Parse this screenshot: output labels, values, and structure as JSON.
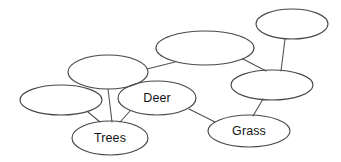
{
  "diagram": {
    "type": "concept-map",
    "background_color": "#ffffff",
    "stroke_color": "#4a4744",
    "edge_color": "#55524f",
    "text_color": "#141414",
    "canvas": {
      "width": 341,
      "height": 162
    },
    "nodes": [
      {
        "id": "node-top-right",
        "label": "",
        "cx": 292,
        "cy": 24,
        "rx": 36,
        "ry": 15
      },
      {
        "id": "node-top-middle",
        "label": "",
        "cx": 205,
        "cy": 48,
        "rx": 49,
        "ry": 17
      },
      {
        "id": "node-right-middle",
        "label": "",
        "cx": 272,
        "cy": 85,
        "rx": 41,
        "ry": 15
      },
      {
        "id": "node-upper-left",
        "label": "",
        "cx": 108,
        "cy": 72,
        "rx": 40,
        "ry": 17
      },
      {
        "id": "node-far-left",
        "label": "",
        "cx": 61,
        "cy": 100,
        "rx": 41,
        "ry": 15
      },
      {
        "id": "node-deer",
        "label": "Deer",
        "cx": 157,
        "cy": 98,
        "rx": 39,
        "ry": 17
      },
      {
        "id": "node-trees",
        "label": "Trees",
        "cx": 110,
        "cy": 138,
        "rx": 38,
        "ry": 17
      },
      {
        "id": "node-grass",
        "label": "Grass",
        "cx": 249,
        "cy": 131,
        "rx": 41,
        "ry": 16
      }
    ],
    "edges": [
      {
        "id": "edge-top-right-to-right-middle",
        "from": "node-top-right",
        "to": "node-right-middle",
        "x1": 285,
        "y1": 39,
        "x2": 281,
        "y2": 71
      },
      {
        "id": "edge-top-middle-to-right-middle",
        "from": "node-top-middle",
        "to": "node-right-middle",
        "x1": 243,
        "y1": 59,
        "x2": 266,
        "y2": 71
      },
      {
        "id": "edge-upper-left-to-top-middle",
        "from": "node-upper-left",
        "to": "node-top-middle",
        "x1": 147,
        "y1": 69,
        "x2": 175,
        "y2": 62
      },
      {
        "id": "edge-upper-left-to-trees",
        "from": "node-upper-left",
        "to": "node-trees",
        "x1": 108,
        "y1": 89,
        "x2": 112,
        "y2": 122
      },
      {
        "id": "edge-far-left-to-trees",
        "from": "node-far-left",
        "to": "node-trees",
        "x1": 88,
        "y1": 112,
        "x2": 100,
        "y2": 122
      },
      {
        "id": "edge-deer-to-trees",
        "from": "node-deer",
        "to": "node-trees",
        "x1": 130,
        "y1": 111,
        "x2": 120,
        "y2": 122
      },
      {
        "id": "edge-deer-to-grass",
        "from": "node-deer",
        "to": "node-grass",
        "x1": 189,
        "y1": 109,
        "x2": 215,
        "y2": 122
      },
      {
        "id": "edge-right-middle-to-grass",
        "from": "node-right-middle",
        "to": "node-grass",
        "x1": 263,
        "y1": 99,
        "x2": 253,
        "y2": 116
      }
    ]
  }
}
